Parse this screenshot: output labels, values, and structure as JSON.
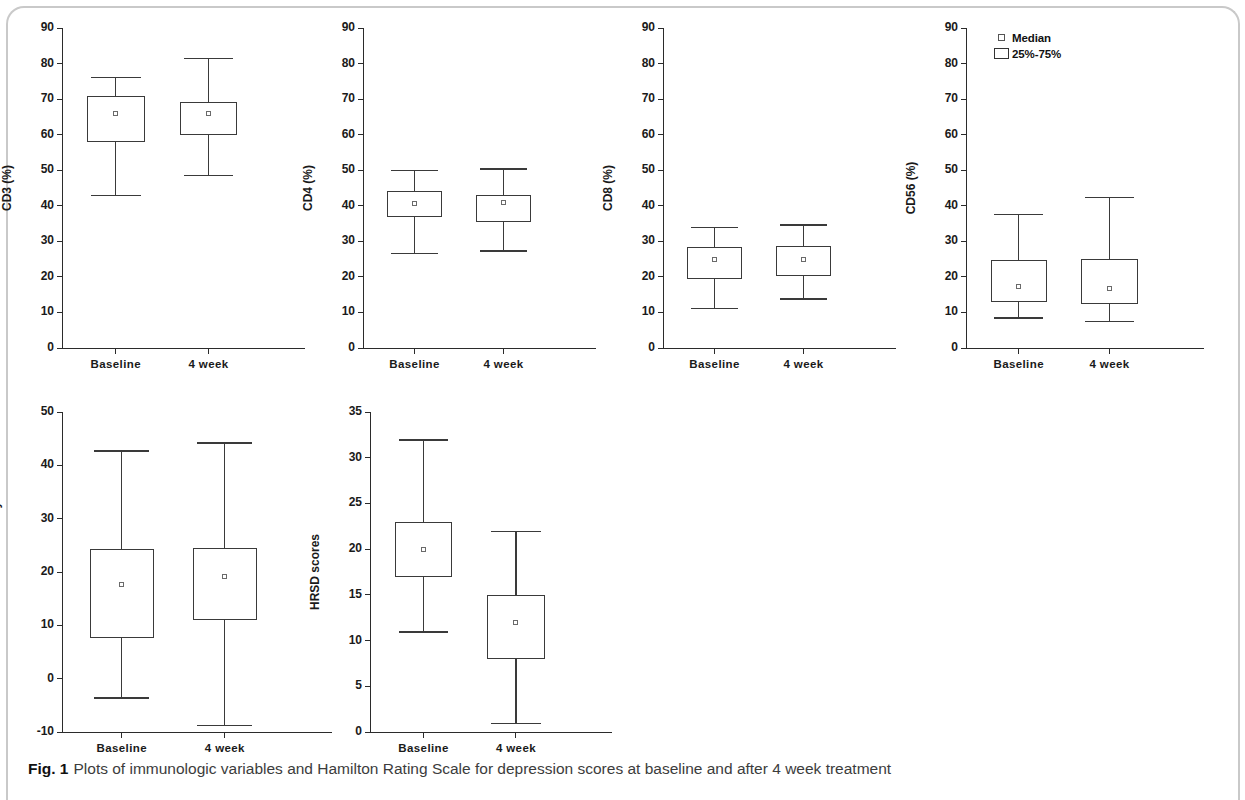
{
  "figure": {
    "label": "Fig. 1",
    "caption": "Plots of immunologic variables and Hamilton Rating Scale for depression scores at baseline and after 4 week treatment"
  },
  "legend": {
    "median_label": "Median",
    "iqr_label": "25%-75%"
  },
  "chart_data": [
    {
      "type": "box",
      "panel_index": 0,
      "title": "",
      "ylabel": "CD3 (%)",
      "xlabel": "",
      "ylim": [
        0,
        90
      ],
      "yticks": [
        0,
        10,
        20,
        30,
        40,
        50,
        60,
        70,
        80,
        90
      ],
      "categories": [
        "Baseline",
        "4 week"
      ],
      "boxes": [
        {
          "category": "Baseline",
          "whisker_low": 43.0,
          "q1": 58.0,
          "median": 66.0,
          "q3": 71.0,
          "whisker_high": 76.3
        },
        {
          "category": "4 week",
          "whisker_low": 48.7,
          "q1": 60.0,
          "median": 66.0,
          "q3": 69.3,
          "whisker_high": 81.7
        }
      ]
    },
    {
      "type": "box",
      "panel_index": 1,
      "title": "",
      "ylabel": "CD4 (%)",
      "xlabel": "",
      "ylim": [
        0,
        90
      ],
      "yticks": [
        0,
        10,
        20,
        30,
        40,
        50,
        60,
        70,
        80,
        90
      ],
      "categories": [
        "Baseline",
        "4 week"
      ],
      "boxes": [
        {
          "category": "Baseline",
          "whisker_low": 26.8,
          "q1": 36.8,
          "median": 40.6,
          "q3": 44.2,
          "whisker_high": 50.2
        },
        {
          "category": "4 week",
          "whisker_low": 27.5,
          "q1": 35.5,
          "median": 41.0,
          "q3": 43.0,
          "whisker_high": 50.5
        }
      ]
    },
    {
      "type": "box",
      "panel_index": 2,
      "title": "",
      "ylabel": "CD8 (%)",
      "xlabel": "",
      "ylim": [
        0,
        90
      ],
      "yticks": [
        0,
        10,
        20,
        30,
        40,
        50,
        60,
        70,
        80,
        90
      ],
      "categories": [
        "Baseline",
        "4 week"
      ],
      "boxes": [
        {
          "category": "Baseline",
          "whisker_low": 11.2,
          "q1": 19.5,
          "median": 25.0,
          "q3": 28.3,
          "whisker_high": 34.0
        },
        {
          "category": "4 week",
          "whisker_low": 14.0,
          "q1": 20.3,
          "median": 24.8,
          "q3": 28.8,
          "whisker_high": 34.8
        }
      ]
    },
    {
      "type": "box",
      "panel_index": 3,
      "title": "",
      "ylabel": "CD56 (%)",
      "xlabel": "",
      "ylim": [
        0,
        90
      ],
      "yticks": [
        0,
        10,
        20,
        30,
        40,
        50,
        60,
        70,
        80,
        90
      ],
      "categories": [
        "Baseline",
        "4 week"
      ],
      "boxes": [
        {
          "category": "Baseline",
          "whisker_low": 8.6,
          "q1": 13.0,
          "median": 17.2,
          "q3": 24.8,
          "whisker_high": 37.8
        },
        {
          "category": "4 week",
          "whisker_low": 7.7,
          "q1": 12.5,
          "median": 16.8,
          "q3": 25.0,
          "whisker_high": 42.6
        }
      ]
    },
    {
      "type": "box",
      "panel_index": 4,
      "title": "",
      "ylabel": "Natural killer cell activity",
      "xlabel": "",
      "ylim": [
        -10,
        50
      ],
      "yticks": [
        -10,
        0,
        10,
        20,
        30,
        40,
        50
      ],
      "categories": [
        "Baseline",
        "4 week"
      ],
      "boxes": [
        {
          "category": "Baseline",
          "whisker_low": -3.5,
          "q1": 7.7,
          "median": 17.7,
          "q3": 24.3,
          "whisker_high": 42.8
        },
        {
          "category": "4 week",
          "whisker_low": -8.6,
          "q1": 11.0,
          "median": 19.2,
          "q3": 24.5,
          "whisker_high": 44.3
        }
      ]
    },
    {
      "type": "box",
      "panel_index": 5,
      "title": "",
      "ylabel": "HRSD scores",
      "xlabel": "",
      "ylim": [
        0,
        35
      ],
      "yticks": [
        0,
        5,
        10,
        15,
        20,
        25,
        30,
        35
      ],
      "categories": [
        "Baseline",
        "4 week"
      ],
      "boxes": [
        {
          "category": "Baseline",
          "whisker_low": 11.0,
          "q1": 17.0,
          "median": 20.0,
          "q3": 23.0,
          "whisker_high": 32.0
        },
        {
          "category": "4 week",
          "whisker_low": 1.0,
          "q1": 8.0,
          "median": 12.0,
          "q3": 15.0,
          "whisker_high": 22.0
        }
      ]
    }
  ]
}
